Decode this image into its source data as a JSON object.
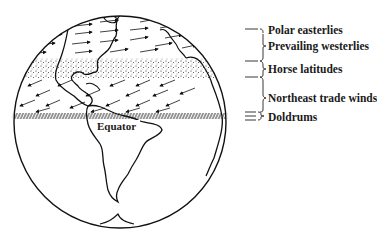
{
  "figure": {
    "equator_label": "Equator",
    "legend": [
      {
        "label": "Polar easterlies",
        "type": "wind-belt"
      },
      {
        "label": "Prevailing westerlies",
        "type": "wind-belt"
      },
      {
        "label": "Horse latitudes",
        "type": "calm-belt"
      },
      {
        "label": "Northeast trade winds",
        "type": "wind-belt"
      },
      {
        "label": "Doldrums",
        "type": "calm-belt"
      }
    ],
    "colors": {
      "ink": "#111111",
      "background": "#ffffff"
    }
  }
}
